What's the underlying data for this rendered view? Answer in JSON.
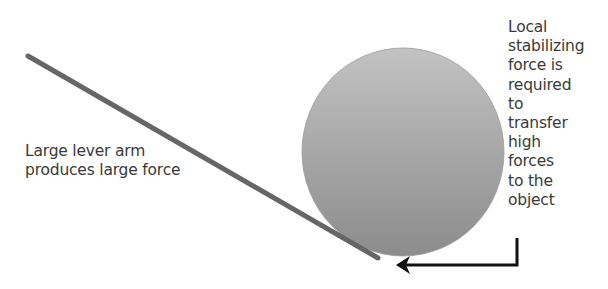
{
  "diagram": {
    "lever_label": {
      "lines": [
        "Large lever arm",
        "produces large force"
      ]
    },
    "stabilizing_label": {
      "lines": [
        "Local",
        "stabilizing",
        "force is",
        "required",
        "to",
        "transfer",
        "high",
        "forces",
        "to the",
        "object"
      ]
    },
    "shapes": {
      "object": {
        "type": "circle",
        "cx": 403,
        "cy": 152,
        "rx": 101,
        "ry": 104,
        "fill_light": "#bdbdbd",
        "fill_dark": "#8f8f8f"
      },
      "lever": {
        "type": "line",
        "x1": 28,
        "y1": 56,
        "x2": 378,
        "y2": 258,
        "color": "#666666",
        "width": 5
      },
      "arrow": {
        "type": "elbow-arrow",
        "points": [
          [
            517,
            238
          ],
          [
            517,
            265
          ],
          [
            400,
            265
          ]
        ],
        "color": "#111111",
        "width": 3
      }
    }
  }
}
